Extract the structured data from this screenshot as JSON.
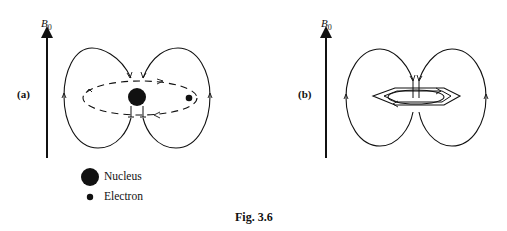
{
  "figure": {
    "caption": "Fig. 3.6",
    "panels": [
      {
        "id": "a",
        "label": "(a)",
        "field_label": "B",
        "field_subscript": "0",
        "description": "Circulating electron around nucleus inducing secondary magnetic field lines"
      },
      {
        "id": "b",
        "label": "(b)",
        "field_label": "B",
        "field_subscript": "0",
        "description": "Ring current in aromatic (benzene) ring inducing secondary magnetic field lines"
      }
    ],
    "legend": [
      {
        "symbol": "large-filled-circle",
        "label": "Nucleus"
      },
      {
        "symbol": "small-filled-circle",
        "label": "Electron"
      }
    ],
    "colors": {
      "ink": "#111111",
      "background": "#ffffff"
    }
  }
}
